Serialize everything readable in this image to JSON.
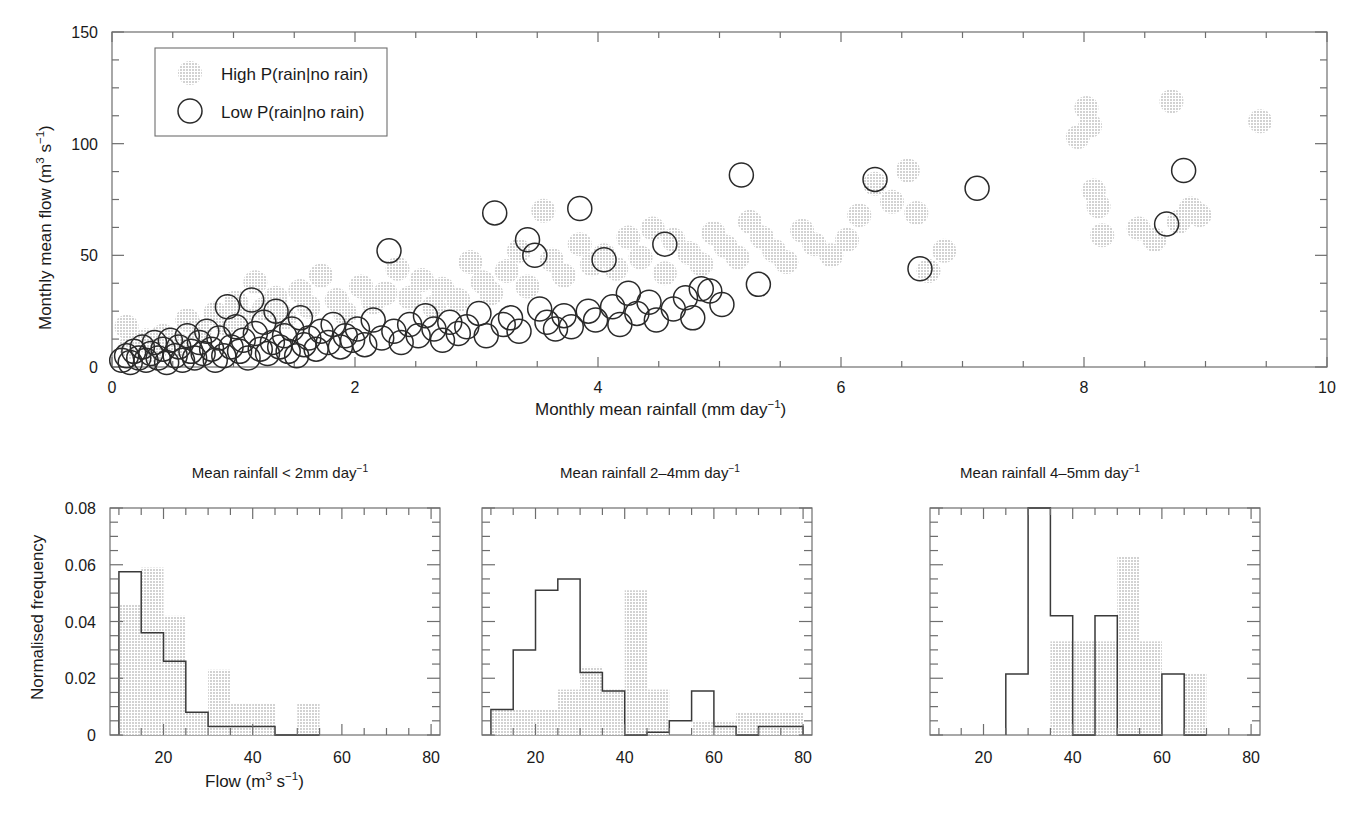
{
  "figure": {
    "background": "#ffffff",
    "colors": {
      "high_fill": "#e3e3e3",
      "low_stroke": "#2a2a2a",
      "axis": "#6e6e6e",
      "text": "#1a1a1a"
    }
  },
  "scatter": {
    "name": "monthly-mean-flow-vs-rainfall",
    "xlabel_parts": {
      "main": "Monthly mean rainfall (mm day",
      "sup": "−1",
      "tail": ")"
    },
    "xlabel": "Monthly mean rainfall (mm day−1)",
    "ylabel": "Monthly mean flow (m3 s−1)",
    "ylabel_parts": {
      "pre": "Monthly mean flow (m",
      "sup1": "3",
      "mid": " s",
      "sup2": "−1",
      "tail": ")"
    },
    "xlim": [
      0,
      10
    ],
    "ylim": [
      0,
      150
    ],
    "xticks": [
      0,
      2,
      4,
      6,
      8,
      10
    ],
    "yticks": [
      0,
      50,
      100,
      150
    ],
    "x_minor_step": 0.5,
    "y_minor_step": 12.5,
    "legend": {
      "items": [
        {
          "label": "High P(rain|no rain)",
          "marker": "filled-circle",
          "name": "legend-high-p"
        },
        {
          "label": "Low P(rain|no rain)",
          "marker": "open-circle",
          "name": "legend-low-p"
        }
      ]
    }
  },
  "chart_data": [
    {
      "type": "scatter",
      "name": "scatter-flow-vs-rainfall",
      "title": "",
      "xlabel": "Monthly mean rainfall (mm day^-1)",
      "ylabel": "Monthly mean flow (m^3 s^-1)",
      "xlim": [
        0,
        10
      ],
      "ylim": [
        0,
        150
      ],
      "xticks": [
        0,
        2,
        4,
        6,
        8,
        10
      ],
      "yticks": [
        0,
        50,
        100,
        150
      ],
      "grid": false,
      "legend_position": "top-left",
      "series": [
        {
          "name": "High P(rain|no rain)",
          "marker": "filled-circle",
          "color": "#e3e3e3",
          "points": [
            [
              0.12,
              18
            ],
            [
              0.15,
              9
            ],
            [
              0.28,
              12
            ],
            [
              0.35,
              7
            ],
            [
              0.42,
              14
            ],
            [
              0.55,
              10
            ],
            [
              0.62,
              21
            ],
            [
              0.72,
              16
            ],
            [
              0.85,
              24
            ],
            [
              0.95,
              19
            ],
            [
              1.02,
              29
            ],
            [
              1.08,
              22
            ],
            [
              1.18,
              38
            ],
            [
              1.25,
              26
            ],
            [
              1.35,
              31
            ],
            [
              1.42,
              22
            ],
            [
              1.55,
              34
            ],
            [
              1.62,
              27
            ],
            [
              1.72,
              41
            ],
            [
              1.85,
              30
            ],
            [
              1.92,
              24
            ],
            [
              2.05,
              36
            ],
            [
              2.15,
              29
            ],
            [
              2.25,
              33
            ],
            [
              2.35,
              44
            ],
            [
              2.45,
              31
            ],
            [
              2.55,
              39
            ],
            [
              2.65,
              27
            ],
            [
              2.72,
              35
            ],
            [
              2.85,
              30
            ],
            [
              2.95,
              47
            ],
            [
              3.05,
              38
            ],
            [
              3.12,
              33
            ],
            [
              3.25,
              43
            ],
            [
              3.35,
              52
            ],
            [
              3.42,
              36
            ],
            [
              3.55,
              70
            ],
            [
              3.62,
              48
            ],
            [
              3.72,
              41
            ],
            [
              3.85,
              55
            ],
            [
              3.95,
              46
            ],
            [
              4.05,
              50
            ],
            [
              4.15,
              44
            ],
            [
              4.25,
              58
            ],
            [
              4.35,
              49
            ],
            [
              4.45,
              62
            ],
            [
              4.55,
              42
            ],
            [
              4.62,
              57
            ],
            [
              4.75,
              51
            ],
            [
              4.85,
              46
            ],
            [
              4.95,
              60
            ],
            [
              5.05,
              54
            ],
            [
              5.15,
              49
            ],
            [
              5.25,
              65
            ],
            [
              5.35,
              58
            ],
            [
              5.45,
              52
            ],
            [
              5.55,
              47
            ],
            [
              5.68,
              61
            ],
            [
              5.78,
              55
            ],
            [
              5.92,
              50
            ],
            [
              6.05,
              57
            ],
            [
              6.15,
              68
            ],
            [
              6.28,
              82
            ],
            [
              6.42,
              74
            ],
            [
              6.55,
              88
            ],
            [
              6.62,
              69
            ],
            [
              6.72,
              43
            ],
            [
              6.85,
              52
            ],
            [
              7.95,
              103
            ],
            [
              8.02,
              116
            ],
            [
              8.05,
              108
            ],
            [
              8.08,
              79
            ],
            [
              8.12,
              72
            ],
            [
              8.15,
              59
            ],
            [
              8.45,
              62
            ],
            [
              8.58,
              57
            ],
            [
              8.72,
              119
            ],
            [
              8.78,
              65
            ],
            [
              8.88,
              71
            ],
            [
              8.95,
              68
            ],
            [
              9.45,
              110
            ]
          ]
        },
        {
          "name": "Low P(rain|no rain)",
          "marker": "open-circle",
          "color": "#ffffff",
          "points": [
            [
              0.08,
              3
            ],
            [
              0.12,
              5
            ],
            [
              0.15,
              2
            ],
            [
              0.18,
              7
            ],
            [
              0.22,
              4
            ],
            [
              0.25,
              9
            ],
            [
              0.28,
              3
            ],
            [
              0.32,
              6
            ],
            [
              0.35,
              11
            ],
            [
              0.38,
              4
            ],
            [
              0.42,
              8
            ],
            [
              0.45,
              2
            ],
            [
              0.48,
              12
            ],
            [
              0.52,
              5
            ],
            [
              0.55,
              9
            ],
            [
              0.58,
              3
            ],
            [
              0.62,
              14
            ],
            [
              0.65,
              7
            ],
            [
              0.68,
              4
            ],
            [
              0.72,
              11
            ],
            [
              0.75,
              6
            ],
            [
              0.78,
              16
            ],
            [
              0.82,
              8
            ],
            [
              0.85,
              3
            ],
            [
              0.88,
              13
            ],
            [
              0.92,
              5
            ],
            [
              0.95,
              27
            ],
            [
              0.98,
              9
            ],
            [
              1.02,
              18
            ],
            [
              1.05,
              7
            ],
            [
              1.08,
              12
            ],
            [
              1.12,
              4
            ],
            [
              1.15,
              30
            ],
            [
              1.18,
              15
            ],
            [
              1.22,
              8
            ],
            [
              1.25,
              20
            ],
            [
              1.28,
              6
            ],
            [
              1.32,
              11
            ],
            [
              1.35,
              25
            ],
            [
              1.38,
              9
            ],
            [
              1.42,
              14
            ],
            [
              1.45,
              7
            ],
            [
              1.48,
              17
            ],
            [
              1.52,
              5
            ],
            [
              1.55,
              22
            ],
            [
              1.58,
              10
            ],
            [
              1.62,
              13
            ],
            [
              1.68,
              8
            ],
            [
              1.72,
              16
            ],
            [
              1.78,
              11
            ],
            [
              1.82,
              19
            ],
            [
              1.88,
              9
            ],
            [
              1.92,
              14
            ],
            [
              1.98,
              12
            ],
            [
              2.02,
              17
            ],
            [
              2.08,
              10
            ],
            [
              2.15,
              21
            ],
            [
              2.22,
              13
            ],
            [
              2.28,
              52
            ],
            [
              2.32,
              16
            ],
            [
              2.38,
              11
            ],
            [
              2.45,
              19
            ],
            [
              2.52,
              14
            ],
            [
              2.58,
              23
            ],
            [
              2.65,
              17
            ],
            [
              2.72,
              12
            ],
            [
              2.78,
              20
            ],
            [
              2.85,
              15
            ],
            [
              2.92,
              18
            ],
            [
              3.02,
              24
            ],
            [
              3.08,
              14
            ],
            [
              3.15,
              69
            ],
            [
              3.22,
              19
            ],
            [
              3.28,
              22
            ],
            [
              3.35,
              16
            ],
            [
              3.42,
              57
            ],
            [
              3.48,
              50
            ],
            [
              3.52,
              26
            ],
            [
              3.58,
              20
            ],
            [
              3.65,
              17
            ],
            [
              3.72,
              23
            ],
            [
              3.78,
              18
            ],
            [
              3.85,
              71
            ],
            [
              3.92,
              25
            ],
            [
              3.98,
              21
            ],
            [
              4.05,
              48
            ],
            [
              4.12,
              27
            ],
            [
              4.18,
              19
            ],
            [
              4.25,
              33
            ],
            [
              4.32,
              24
            ],
            [
              4.42,
              29
            ],
            [
              4.48,
              21
            ],
            [
              4.55,
              55
            ],
            [
              4.62,
              26
            ],
            [
              4.72,
              31
            ],
            [
              4.78,
              22
            ],
            [
              4.85,
              35
            ],
            [
              4.92,
              34
            ],
            [
              5.02,
              28
            ],
            [
              5.18,
              86
            ],
            [
              5.32,
              37
            ],
            [
              6.28,
              84
            ],
            [
              6.65,
              44
            ],
            [
              7.12,
              80
            ],
            [
              8.68,
              64
            ],
            [
              8.82,
              88
            ]
          ]
        }
      ]
    },
    {
      "type": "bar",
      "name": "histogram-lt-2mm",
      "title": "Mean rainfall < 2mm day^-1",
      "xlabel": "Flow (m^3 s^-1)",
      "ylabel": "Normalised frequency",
      "xlim": [
        8,
        82
      ],
      "ylim": [
        0,
        0.08
      ],
      "xticks": [
        20,
        40,
        60,
        80
      ],
      "yticks": [
        0,
        0.02,
        0.04,
        0.06,
        0.08
      ],
      "bin_edges": [
        10,
        15,
        20,
        25,
        30,
        35,
        40,
        45,
        50,
        55
      ],
      "series": [
        {
          "name": "High P(rain|no rain)",
          "style": "filled-gray",
          "values": [
            0.046,
            0.059,
            0.042,
            0.008,
            0.023,
            0.011,
            0.011,
            0.0,
            0.011
          ]
        },
        {
          "name": "Low P(rain|no rain)",
          "style": "open",
          "values": [
            0.0575,
            0.036,
            0.026,
            0.008,
            0.003,
            0.003,
            0.003,
            0.0,
            0.0
          ]
        }
      ]
    },
    {
      "type": "bar",
      "name": "histogram-2-4mm",
      "title": "Mean rainfall 2–4mm day^-1",
      "xlabel": "Flow (m^3 s^-1)",
      "ylabel": "Normalised frequency",
      "xlim": [
        8,
        82
      ],
      "ylim": [
        0,
        0.08
      ],
      "xticks": [
        20,
        40,
        60,
        80
      ],
      "yticks": [
        0,
        0.02,
        0.04,
        0.06,
        0.08
      ],
      "bin_edges": [
        10,
        15,
        20,
        25,
        30,
        35,
        40,
        45,
        50,
        55,
        60,
        65,
        70,
        75,
        80
      ],
      "series": [
        {
          "name": "High P(rain|no rain)",
          "style": "filled-gray",
          "values": [
            0.009,
            0.009,
            0.009,
            0.016,
            0.024,
            0.016,
            0.051,
            0.016,
            0.0,
            0.005,
            0.005,
            0.008,
            0.008,
            0.008
          ]
        },
        {
          "name": "Low P(rain|no rain)",
          "style": "open",
          "values": [
            0.009,
            0.03,
            0.051,
            0.055,
            0.022,
            0.0155,
            0.0,
            0.001,
            0.005,
            0.0155,
            0.003,
            0.0,
            0.003,
            0.003
          ]
        }
      ]
    },
    {
      "type": "bar",
      "name": "histogram-4-5mm",
      "title": "Mean rainfall 4–5mm day^-1",
      "xlabel": "Flow (m^3 s^-1)",
      "ylabel": "Normalised frequency",
      "xlim": [
        8,
        82
      ],
      "ylim": [
        0,
        0.08
      ],
      "xticks": [
        20,
        40,
        60,
        80
      ],
      "yticks": [
        0,
        0.02,
        0.04,
        0.06,
        0.08
      ],
      "bin_edges": [
        25,
        30,
        35,
        40,
        45,
        50,
        55,
        60,
        65,
        70
      ],
      "series": [
        {
          "name": "High P(rain|no rain)",
          "style": "filled-gray",
          "values": [
            0.0,
            0.0,
            0.033,
            0.033,
            0.033,
            0.063,
            0.033,
            0.0,
            0.0215
          ]
        },
        {
          "name": "Low P(rain|no rain)",
          "style": "open",
          "values": [
            0.0215,
            0.08,
            0.042,
            0.0,
            0.042,
            0.0,
            0.0,
            0.0215,
            0.0
          ]
        }
      ]
    }
  ],
  "histograms": {
    "ylabel": "Normalised frequency",
    "xlabel": "Flow (m3 s−1)",
    "xlabel_parts": {
      "pre": "Flow (m",
      "sup1": "3",
      "mid": " s",
      "sup2": "−1",
      "tail": ")"
    },
    "ytick_labels": [
      "0",
      "0.02",
      "0.04",
      "0.06",
      "0.08"
    ],
    "xtick_labels": [
      "20",
      "40",
      "60",
      "80"
    ],
    "panels": [
      {
        "title_pre": "Mean rainfall < 2mm day",
        "title_sup": "−1",
        "title_tail": "",
        "name": "panel-lt-2mm"
      },
      {
        "title_pre": "Mean rainfall 2–4mm day",
        "title_sup": "−1",
        "title_tail": "",
        "name": "panel-2-4mm"
      },
      {
        "title_pre": "Mean rainfall 4–5mm day",
        "title_sup": "−1",
        "title_tail": "",
        "name": "panel-4-5mm"
      }
    ]
  }
}
